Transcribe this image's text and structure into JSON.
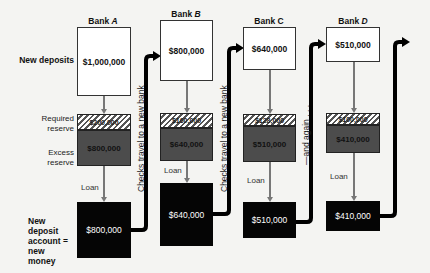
{
  "banks": [
    {
      "name": "Bank",
      "letter": "A",
      "new_deposit": "$1,000,000",
      "required_reserve": "$200,000",
      "excess_reserve": "$800,000",
      "new_account": "$800,000"
    },
    {
      "name": "Bank",
      "letter": "B",
      "new_deposit": "$800,000",
      "required_reserve": "$160,000",
      "excess_reserve": "$640,000",
      "new_account": "$640,000"
    },
    {
      "name": "Bank",
      "letter": "C",
      "new_deposit": "$640,000",
      "required_reserve": "$128,000",
      "excess_reserve": "$510,000",
      "new_account": "$510,000"
    },
    {
      "name": "Bank",
      "letter": "D",
      "new_deposit": "$510,000",
      "required_reserve": "$100,000",
      "excess_reserve": "$410,000",
      "new_account": "$410,000"
    }
  ],
  "row_labels": {
    "new_deposits": "New deposits",
    "required_reserve_1": "Required",
    "required_reserve_2": "reserve",
    "excess_reserve_1": "Excess",
    "excess_reserve_2": "reserve",
    "new_account_1": "New deposit",
    "new_account_2": "account =",
    "new_account_3": "new money"
  },
  "loan_label": "Loan",
  "checks_label": "Checks travel to a new bank",
  "again_label": "—and again . . ."
}
